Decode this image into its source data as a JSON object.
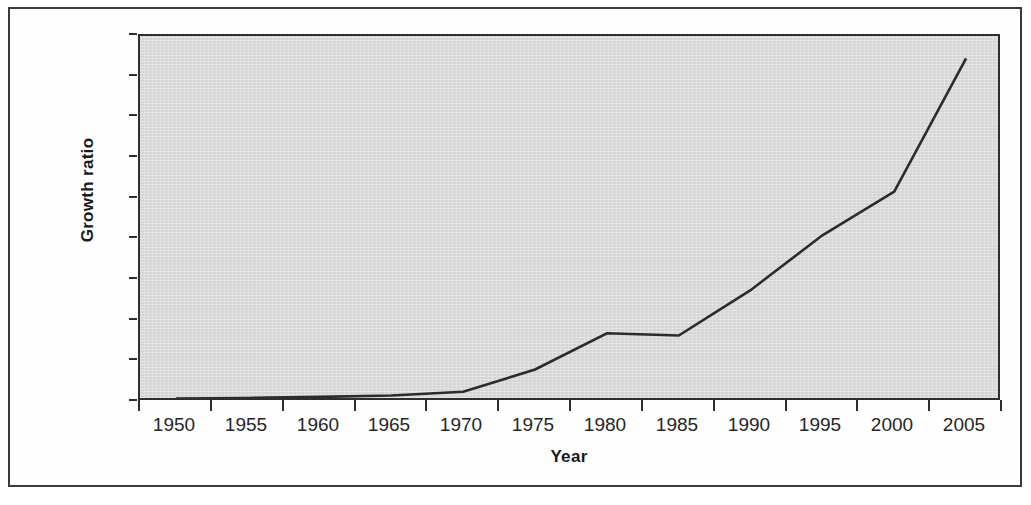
{
  "chart_data": {
    "type": "line",
    "title": "",
    "xlabel": "Year",
    "ylabel": "Growth ratio",
    "categories": [
      "1950",
      "1955",
      "1960",
      "1965",
      "1970",
      "1975",
      "1980",
      "1985",
      "1990",
      "1995",
      "2000",
      "2005"
    ],
    "values": [
      1.7,
      2.0,
      2.5,
      3.2,
      5.0,
      16.0,
      33.8,
      32.7,
      55.0,
      82.0,
      103.5,
      169.0
    ],
    "series": [
      {
        "name": "Growth ratio",
        "values": [
          1.7,
          2.0,
          2.5,
          3.2,
          5.0,
          16.0,
          33.8,
          32.7,
          55.0,
          82.0,
          103.5,
          169.0
        ]
      }
    ],
    "ylim": [
      0.0,
      180.0
    ],
    "y_ticks": [
      "0,0",
      "20,0",
      "40,0",
      "60,0",
      "80,0",
      "100,0",
      "120,0",
      "140,0",
      "160,0",
      "180,0"
    ],
    "y_tick_values": [
      0,
      20,
      40,
      60,
      80,
      100,
      120,
      140,
      160,
      180
    ],
    "x_tick_labels": [
      "1950",
      "1955",
      "1960",
      "1965",
      "1970",
      "1975",
      "1980",
      "1985",
      "1990",
      "1995",
      "2000",
      "2005"
    ],
    "grid": false,
    "legend": "none",
    "decimal_separator": ",",
    "line_color": "#2b2b2b",
    "plot_background_color": "#d5d5d5",
    "frame_color": "#3a3a3a",
    "figure_background_color": "#ffffff"
  }
}
